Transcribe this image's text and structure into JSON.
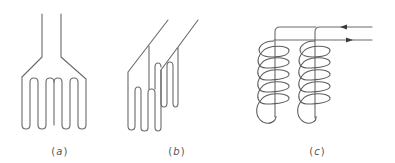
{
  "figure": {
    "panels": [
      {
        "id": "a",
        "label": "(a)",
        "letter": "a",
        "description": "Single flat serpentine (meander) heating element with two parallel leads diverging into four U-shaped folds"
      },
      {
        "id": "b",
        "label": "(b)",
        "letter": "b",
        "description": "Two offset serpentine elements shown in perspective with diagonal leads"
      },
      {
        "id": "c",
        "label": "(c)",
        "letter": "c",
        "description": "Two helical coil elements connected in series; current arrows on leads (top pointing left, bottom pointing right)"
      }
    ],
    "colors": {
      "line": "#6a6a6a",
      "arrow": "#3a3a3a",
      "label": "#555555",
      "background": "#ffffff"
    },
    "arrows": [
      {
        "line": "top",
        "direction": "left"
      },
      {
        "line": "bottom",
        "direction": "right"
      }
    ]
  }
}
